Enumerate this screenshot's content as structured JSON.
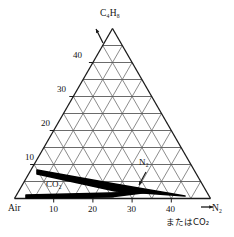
{
  "chart_data": {
    "type": "line",
    "title": "",
    "subtitle": "",
    "diagram_kind": "ternary-flammability-triangle",
    "apex_label": "C4H8",
    "apex_label_display": "C₄H₈",
    "left_axis": {
      "label": "",
      "ticks": [
        10,
        20,
        30,
        40
      ],
      "tick_labels": [
        "10",
        "20",
        "30",
        "40"
      ],
      "range": [
        0,
        50
      ],
      "gridstep": 5
    },
    "bottom_axis": {
      "origin_label": "Air",
      "label": "N2",
      "label_display": "N₂",
      "label_secondary": "またはCO₂",
      "ticks": [
        10,
        20,
        30,
        40
      ],
      "tick_labels": [
        "10",
        "20",
        "30",
        "40"
      ],
      "range": [
        0,
        50
      ],
      "gridstep": 5
    },
    "grid": true,
    "legend_position": "inline-annotations",
    "annotations": [
      {
        "name": "co2-curve-label",
        "text": "CO2",
        "text_display": "CO₂",
        "x_px": 46,
        "y_px": 184
      },
      {
        "name": "n2-curve-label",
        "text": "N2",
        "text_display": "N₂",
        "x_px": 140,
        "y_px": 162
      }
    ],
    "series": [
      {
        "name": "N2 flammability envelope",
        "label_display": "N₂",
        "points_px": [
          [
            37,
            170
          ],
          [
            115,
            184
          ],
          [
            185,
            196
          ],
          [
            115,
            191
          ],
          [
            37,
            174
          ]
        ]
      },
      {
        "name": "CO2 flammability envelope",
        "label_display": "CO₂",
        "points_px": [
          [
            26,
            195
          ],
          [
            110,
            193
          ],
          [
            150,
            192
          ],
          [
            110,
            197
          ],
          [
            26,
            198
          ]
        ]
      }
    ]
  },
  "axes": {
    "left_ticks": [
      "40",
      "30",
      "20",
      "10"
    ],
    "bottom_ticks": [
      "10",
      "20",
      "30",
      "40"
    ],
    "origin": "Air",
    "apex": "C₄H₈",
    "right_arrow_label": "N₂",
    "right_sub_label": "またはCO₂"
  },
  "colors": {
    "background": "#ffffff",
    "grid": "#5a5a5a",
    "outline": "#1a1a1a",
    "curve": "#000000",
    "text": "#111111"
  }
}
